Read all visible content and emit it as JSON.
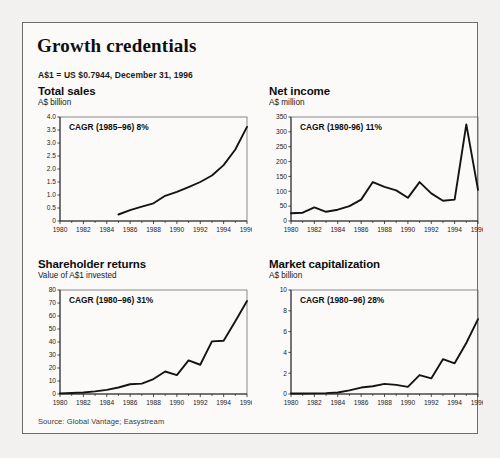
{
  "exhibit": {
    "title": "Growth credentials",
    "fx_note": "A$1 = US $0.7944, December 31, 1996",
    "source": "Source: Global Vantage; Easystream"
  },
  "chart_data": [
    {
      "type": "line",
      "title": "Total sales",
      "ylabel": "A$ billion",
      "xlabel": "",
      "annotation": "CAGR (1985–96) 8%",
      "grid": false,
      "legend": "none",
      "xlim": [
        1980,
        1996
      ],
      "ylim": [
        0,
        4.0
      ],
      "yticks": [
        0,
        0.5,
        1.0,
        1.5,
        2.0,
        2.5,
        3.0,
        3.5,
        4.0
      ],
      "ytick_labels": [
        "0",
        "0.5",
        "1.0",
        "1.5",
        "2.0",
        "2.5",
        "3.0",
        "3.5",
        "4.0"
      ],
      "xticks": [
        1980,
        1982,
        1984,
        1986,
        1988,
        1990,
        1992,
        1994,
        1996
      ],
      "xtick_labels": [
        "1980",
        "1982",
        "1984",
        "1986",
        "1988",
        "1990",
        "1992",
        "1994",
        "1996"
      ],
      "x": [
        1985,
        1986,
        1987,
        1988,
        1989,
        1990,
        1991,
        1992,
        1993,
        1994,
        1995,
        1996
      ],
      "values": [
        0.25,
        0.42,
        0.55,
        0.68,
        0.97,
        1.12,
        1.3,
        1.5,
        1.75,
        2.15,
        2.75,
        3.62
      ]
    },
    {
      "type": "line",
      "title": "Net income",
      "ylabel": "A$ million",
      "xlabel": "",
      "annotation": "CAGR (1980-96) 11%",
      "grid": false,
      "legend": "none",
      "xlim": [
        1980,
        1996
      ],
      "ylim": [
        0,
        350
      ],
      "yticks": [
        0,
        50,
        100,
        150,
        200,
        250,
        300,
        350
      ],
      "ytick_labels": [
        "0",
        "50",
        "100",
        "150",
        "200",
        "250",
        "300",
        "350"
      ],
      "xticks": [
        1980,
        1982,
        1984,
        1986,
        1988,
        1990,
        1992,
        1994,
        1996
      ],
      "xtick_labels": [
        "1980",
        "1982",
        "1984",
        "1986",
        "1988",
        "1990",
        "1992",
        "1994",
        "1996"
      ],
      "x": [
        1980,
        1981,
        1982,
        1983,
        1984,
        1985,
        1986,
        1987,
        1988,
        1989,
        1990,
        1991,
        1992,
        1993,
        1994,
        1995,
        1996
      ],
      "values": [
        26,
        28,
        46,
        31,
        38,
        50,
        72,
        131,
        115,
        103,
        78,
        131,
        93,
        68,
        72,
        325,
        105,
        133
      ]
    },
    {
      "type": "line",
      "title": "Shareholder returns",
      "ylabel": "Value of A$1 invested",
      "xlabel": "",
      "annotation": "CAGR (1980–96) 31%",
      "grid": false,
      "legend": "none",
      "xlim": [
        1980,
        1996
      ],
      "ylim": [
        0,
        80
      ],
      "yticks": [
        0,
        10,
        20,
        30,
        40,
        50,
        60,
        70,
        80
      ],
      "ytick_labels": [
        "0",
        "10",
        "20",
        "30",
        "40",
        "50",
        "60",
        "70",
        "80"
      ],
      "xticks": [
        1980,
        1982,
        1984,
        1986,
        1988,
        1990,
        1992,
        1994,
        1996
      ],
      "xtick_labels": [
        "1980",
        "1982",
        "1984",
        "1986",
        "1988",
        "1990",
        "1992",
        "1994",
        "1996"
      ],
      "x": [
        1980,
        1981,
        1982,
        1983,
        1984,
        1985,
        1986,
        1987,
        1988,
        1989,
        1990,
        1991,
        1992,
        1993,
        1994,
        1995,
        1996
      ],
      "values": [
        0.5,
        0.8,
        1.2,
        2.0,
        3.2,
        5.0,
        7.5,
        8.0,
        11.5,
        17.3,
        14.5,
        25.8,
        22.5,
        40.5,
        41.0,
        56.0,
        71.5
      ]
    },
    {
      "type": "line",
      "title": "Market capitalization",
      "ylabel": "A$ billion",
      "xlabel": "",
      "annotation": "CAGR (1980–96) 28%",
      "grid": false,
      "legend": "none",
      "xlim": [
        1980,
        1996
      ],
      "ylim": [
        0,
        10
      ],
      "yticks": [
        0,
        2,
        4,
        6,
        8,
        10
      ],
      "ytick_labels": [
        "0",
        "2",
        "4",
        "6",
        "8",
        "10"
      ],
      "xticks": [
        1980,
        1982,
        1984,
        1986,
        1988,
        1990,
        1992,
        1994,
        1996
      ],
      "xtick_labels": [
        "1980",
        "1982",
        "1984",
        "1986",
        "1988",
        "1990",
        "1992",
        "1994",
        "1996"
      ],
      "x": [
        1980,
        1981,
        1982,
        1983,
        1984,
        1985,
        1986,
        1987,
        1988,
        1989,
        1990,
        1991,
        1992,
        1993,
        1994,
        1995,
        1996
      ],
      "values": [
        0.05,
        0.05,
        0.06,
        0.08,
        0.15,
        0.35,
        0.62,
        0.75,
        0.97,
        0.88,
        0.68,
        1.82,
        1.5,
        3.35,
        2.95,
        4.9,
        7.2
      ]
    }
  ]
}
